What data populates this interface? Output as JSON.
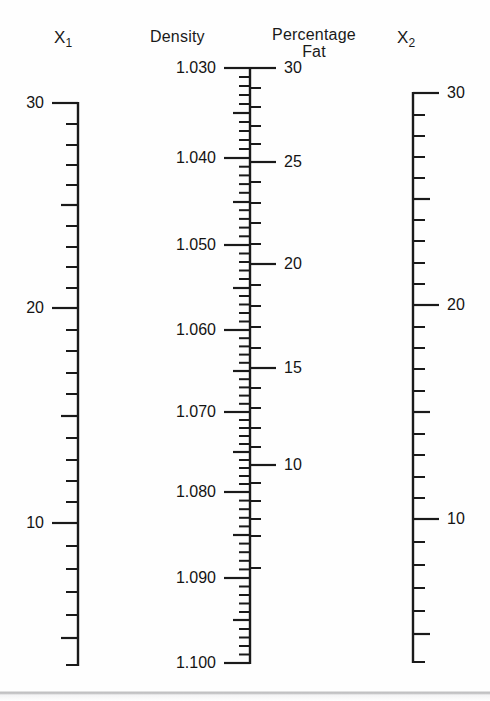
{
  "figure": {
    "type": "nomogram",
    "width": 490,
    "height": 701,
    "background_color": "#fefefe",
    "line_color": "#1a1a1a"
  },
  "axes": {
    "x1": {
      "title": "X",
      "subscript": "1",
      "label_side": "left",
      "tick_labels": [
        "30",
        "20",
        "10"
      ]
    },
    "density": {
      "title": "Density",
      "label_side": "left",
      "tick_labels": [
        "1.030",
        "1.040",
        "1.050",
        "1.060",
        "1.070",
        "1.080",
        "1.090",
        "1.100"
      ]
    },
    "fat": {
      "title_line1": "Percentage",
      "title_line2": "Fat",
      "label_side": "right",
      "tick_labels": [
        "30",
        "25",
        "20",
        "15",
        "10"
      ]
    },
    "x2": {
      "title": "X",
      "subscript": "2",
      "label_side": "right",
      "tick_labels": [
        "30",
        "20",
        "10"
      ]
    }
  },
  "chart_data": {
    "type": "nomogram",
    "title": "",
    "subtitle": "",
    "grid": false,
    "legend": false,
    "scales": [
      {
        "name": "x1",
        "label": "X1",
        "label_text": "X₁",
        "title_side": "top",
        "axis_x": 78,
        "y_top": 103,
        "y_bottom": 665,
        "label_side": "left",
        "major_ticks": [
          {
            "value": 30,
            "label": "30",
            "y": 103
          },
          {
            "value": 20,
            "label": "20",
            "y": 308
          },
          {
            "value": 10,
            "label": "10",
            "y": 523
          }
        ],
        "medium_ticks": [
          {
            "value": 25,
            "y": 205
          },
          {
            "value": 15,
            "y": 416
          },
          {
            "value": 5,
            "y": 638
          }
        ],
        "minor_ticks": [
          {
            "value": 29,
            "y": 124
          },
          {
            "value": 28,
            "y": 145
          },
          {
            "value": 27,
            "y": 165
          },
          {
            "value": 26,
            "y": 185
          },
          {
            "value": 24,
            "y": 226
          },
          {
            "value": 23,
            "y": 247
          },
          {
            "value": 22,
            "y": 267
          },
          {
            "value": 21,
            "y": 288
          },
          {
            "value": 19,
            "y": 330
          },
          {
            "value": 18,
            "y": 351
          },
          {
            "value": 17,
            "y": 373
          },
          {
            "value": 16,
            "y": 394
          },
          {
            "value": 14,
            "y": 438
          },
          {
            "value": 13,
            "y": 460
          },
          {
            "value": 12,
            "y": 481
          },
          {
            "value": 11,
            "y": 502
          },
          {
            "value": 9,
            "y": 546
          },
          {
            "value": 8,
            "y": 569
          },
          {
            "value": 7,
            "y": 592
          },
          {
            "value": 6,
            "y": 615
          },
          {
            "value": 4,
            "y": 665
          }
        ],
        "range": [
          4,
          30
        ],
        "units_per_minor": 1
      },
      {
        "name": "density",
        "label": "Density",
        "label_text": "Density",
        "title_side": "top",
        "axis_x": 250,
        "y_top": 68,
        "y_bottom": 663,
        "label_side": "left",
        "major_ticks": [
          {
            "value": 1.03,
            "label": "1.030",
            "y": 68
          },
          {
            "value": 1.04,
            "label": "1.040",
            "y": 158
          },
          {
            "value": 1.05,
            "label": "1.050",
            "y": 245
          },
          {
            "value": 1.06,
            "label": "1.060",
            "y": 330
          },
          {
            "value": 1.07,
            "label": "1.070",
            "y": 412
          },
          {
            "value": 1.08,
            "label": "1.080",
            "y": 492
          },
          {
            "value": 1.09,
            "label": "1.090",
            "y": 578
          },
          {
            "value": 1.1,
            "label": "1.100",
            "y": 663
          }
        ],
        "medium_ticks": [
          {
            "value": 1.035,
            "y": 113
          },
          {
            "value": 1.045,
            "y": 202
          },
          {
            "value": 1.055,
            "y": 288
          },
          {
            "value": 1.065,
            "y": 371
          },
          {
            "value": 1.075,
            "y": 452
          },
          {
            "value": 1.085,
            "y": 535
          },
          {
            "value": 1.095,
            "y": 620
          }
        ],
        "minor_step": 0.001,
        "range": [
          1.03,
          1.1
        ],
        "units_per_minor": 0.001
      },
      {
        "name": "fat",
        "label": "Percentage Fat",
        "label_text": "Percentage Fat",
        "title_side": "top",
        "axis_x": 250,
        "y_top": 68,
        "y_bottom": 663,
        "label_side": "right",
        "major_ticks": [
          {
            "value": 30,
            "label": "30",
            "y": 68
          },
          {
            "value": 25,
            "label": "25",
            "y": 162
          },
          {
            "value": 20,
            "label": "20",
            "y": 264
          },
          {
            "value": 15,
            "label": "15",
            "y": 368
          },
          {
            "value": 10,
            "label": "10",
            "y": 465
          }
        ],
        "minor_ticks": [
          {
            "value": 29,
            "y": 88
          },
          {
            "value": 28,
            "y": 107
          },
          {
            "value": 27,
            "y": 126
          },
          {
            "value": 26,
            "y": 144
          },
          {
            "value": 24,
            "y": 182
          },
          {
            "value": 23,
            "y": 203
          },
          {
            "value": 22,
            "y": 223
          },
          {
            "value": 21,
            "y": 244
          },
          {
            "value": 19,
            "y": 285
          },
          {
            "value": 18,
            "y": 306
          },
          {
            "value": 17,
            "y": 327
          },
          {
            "value": 16,
            "y": 348
          },
          {
            "value": 14,
            "y": 388
          },
          {
            "value": 13,
            "y": 408
          },
          {
            "value": 12,
            "y": 428
          },
          {
            "value": 11,
            "y": 447
          },
          {
            "value": 9,
            "y": 483
          },
          {
            "value": 8,
            "y": 501
          },
          {
            "value": 7,
            "y": 519
          },
          {
            "value": 6,
            "y": 536
          },
          {
            "value": 5,
            "y": 568
          }
        ],
        "range": [
          5,
          30
        ],
        "units_per_minor": 1
      },
      {
        "name": "x2",
        "label": "X2",
        "label_text": "X₂",
        "title_side": "top",
        "axis_x": 413,
        "y_top": 93,
        "y_bottom": 662,
        "label_side": "right",
        "major_ticks": [
          {
            "value": 30,
            "label": "30",
            "y": 93
          },
          {
            "value": 20,
            "label": "20",
            "y": 305
          },
          {
            "value": 10,
            "label": "10",
            "y": 519
          }
        ],
        "medium_ticks": [
          {
            "value": 25,
            "y": 199
          },
          {
            "value": 15,
            "y": 412
          },
          {
            "value": 5,
            "y": 634
          }
        ],
        "minor_ticks": [
          {
            "value": 29,
            "y": 115
          },
          {
            "value": 28,
            "y": 136
          },
          {
            "value": 27,
            "y": 157
          },
          {
            "value": 26,
            "y": 178
          },
          {
            "value": 24,
            "y": 220
          },
          {
            "value": 23,
            "y": 241
          },
          {
            "value": 22,
            "y": 263
          },
          {
            "value": 21,
            "y": 284
          },
          {
            "value": 19,
            "y": 327
          },
          {
            "value": 18,
            "y": 348
          },
          {
            "value": 17,
            "y": 369
          },
          {
            "value": 16,
            "y": 391
          },
          {
            "value": 14,
            "y": 434
          },
          {
            "value": 13,
            "y": 455
          },
          {
            "value": 12,
            "y": 477
          },
          {
            "value": 11,
            "y": 498
          },
          {
            "value": 9,
            "y": 542
          },
          {
            "value": 8,
            "y": 565
          },
          {
            "value": 7,
            "y": 588
          },
          {
            "value": 6,
            "y": 611
          },
          {
            "value": 4,
            "y": 662
          }
        ],
        "range": [
          4,
          30
        ],
        "units_per_minor": 1
      }
    ]
  }
}
